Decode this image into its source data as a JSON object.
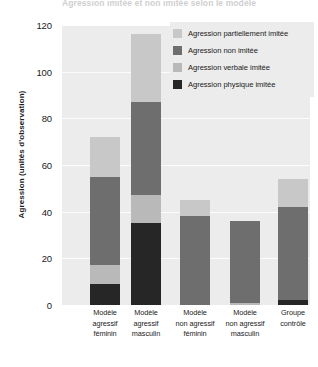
{
  "chart_data": {
    "type": "bar",
    "title": "Agression imitée et non imitée selon le modèle",
    "xlabel": "",
    "ylabel": "Agression (unités d'observation)",
    "ylim": [
      0,
      120
    ],
    "yticks": [
      0,
      20,
      40,
      60,
      80,
      100,
      120
    ],
    "grid": true,
    "stacked": true,
    "legend_position": "top-right",
    "categories": [
      "Modèle agressif féminin",
      "Modèle agressif masculin",
      "Modèle non agressif féminin",
      "Modèle non agressif masculin",
      "Groupe contrôle"
    ],
    "series": [
      {
        "name": "Agression physique imitée",
        "color": "#262626",
        "values": [
          9,
          35,
          0,
          0,
          2
        ]
      },
      {
        "name": "Agression verbale imitée",
        "color": "#b9b9b9",
        "values": [
          8,
          12,
          0,
          1,
          0
        ]
      },
      {
        "name": "Agression non imitée",
        "color": "#6e6e6e",
        "values": [
          38,
          40,
          38,
          35,
          40
        ]
      },
      {
        "name": "Agression partiellement imitée",
        "color": "#c8c8c8",
        "values": [
          17,
          29,
          7,
          0,
          12
        ]
      }
    ],
    "totals": [
      72,
      116,
      45,
      36,
      54
    ]
  },
  "axes": {
    "y_label": "Agression (unités d'observation)",
    "y_ticks": [
      "0",
      "20",
      "40",
      "60",
      "80",
      "100",
      "120"
    ],
    "x_categories": [
      [
        "Modèle",
        "agressif",
        "féminin"
      ],
      [
        "Modèle",
        "agressif",
        "masculin"
      ],
      [
        "Modèle",
        "non agressif",
        "féminin"
      ],
      [
        "Modèle",
        "non agressif",
        "masculin"
      ],
      [
        "Groupe",
        "contrôle"
      ]
    ]
  },
  "legend": {
    "items": [
      {
        "label": "Agression partiellement imitée",
        "color": "#c8c8c8"
      },
      {
        "label": "Agression non imitée",
        "color": "#6e6e6e"
      },
      {
        "label": "Agression verbale imitée",
        "color": "#b9b9b9"
      },
      {
        "label": "Agression physique imitée",
        "color": "#262626"
      }
    ]
  },
  "title": "Agression imitée et non imitée selon le modèle",
  "colors": {
    "plot_background": "#ececec",
    "page_background": "#ffffff",
    "text": "#1b1b1b",
    "gridline": "#ffffff"
  }
}
